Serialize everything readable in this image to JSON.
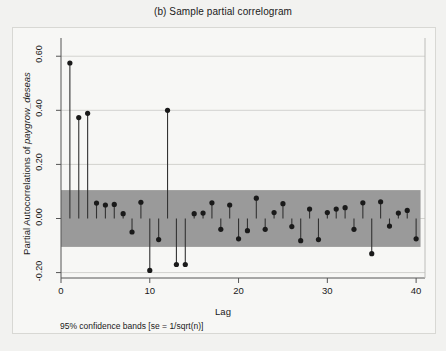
{
  "chart_data": {
    "type": "scatter",
    "title": "(b)  Sample partial correlogram",
    "xlabel": "Lag",
    "ylabel_prefix": "Partial Autocorrelations of ",
    "ylabel_variable": "paygrow_deseas",
    "footnote": "95% confidence bands [se = 1/sqrt(n)]",
    "grid": true,
    "legend": "none",
    "xlim": [
      0,
      41
    ],
    "ylim": [
      -0.22,
      0.66
    ],
    "xticks": [
      0,
      10,
      20,
      30,
      40
    ],
    "xtick_labels": [
      "0",
      "10",
      "20",
      "30",
      "40"
    ],
    "yticks": [
      -0.2,
      0.0,
      0.2,
      0.4,
      0.6
    ],
    "ytick_labels": [
      "-0.20",
      "0.00",
      "0.20",
      "0.40",
      "0.60"
    ],
    "confidence_band": {
      "label": "95% confidence bands",
      "upper": 0.105,
      "lower": -0.105,
      "color": "#9a9a9a"
    },
    "marker_color": "#1a1a1a",
    "stem_color": "#333333",
    "x": [
      1,
      2,
      3,
      4,
      5,
      6,
      7,
      8,
      9,
      10,
      11,
      12,
      13,
      14,
      15,
      16,
      17,
      18,
      19,
      20,
      21,
      22,
      23,
      24,
      25,
      26,
      27,
      28,
      29,
      30,
      31,
      32,
      33,
      34,
      35,
      36,
      37,
      38,
      39,
      40
    ],
    "values": [
      0.575,
      0.373,
      0.389,
      0.057,
      0.05,
      0.052,
      0.018,
      -0.05,
      0.06,
      -0.192,
      -0.078,
      0.4,
      -0.17,
      -0.17,
      0.018,
      0.02,
      0.058,
      -0.04,
      0.05,
      -0.075,
      -0.045,
      0.075,
      -0.04,
      0.022,
      0.055,
      -0.03,
      -0.082,
      0.035,
      -0.078,
      0.022,
      0.035,
      0.04,
      -0.04,
      0.058,
      -0.13,
      0.062,
      -0.028,
      0.02,
      0.03,
      -0.075
    ]
  },
  "plot": {
    "frame_color": "#555555",
    "background": "#f7f7f5",
    "page_background": "#f2f2f0",
    "gridline_color": "#c9c9c5"
  }
}
